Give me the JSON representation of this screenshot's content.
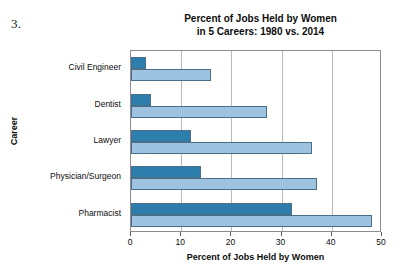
{
  "item_number": "3.",
  "chart_data": {
    "type": "bar",
    "orientation": "horizontal",
    "title": "Percent of Jobs Held by Women in 5 Careers: 1980 vs. 2014",
    "title_lines": [
      "Percent of Jobs Held by Women",
      "in 5 Careers: 1980 vs. 2014"
    ],
    "xlabel": "Percent of Jobs Held by Women",
    "ylabel": "Career",
    "categories": [
      "Civil Engineer",
      "Dentist",
      "Lawyer",
      "Physician/Surgeon",
      "Pharmacist"
    ],
    "series": [
      {
        "name": "1980",
        "color": "#2e7ead",
        "values": [
          3,
          4,
          12,
          14,
          32
        ]
      },
      {
        "name": "2014",
        "color": "#9dc3e0",
        "values": [
          16,
          27,
          36,
          37,
          48
        ]
      }
    ],
    "xlim": [
      0,
      50
    ],
    "xticks": [
      0,
      10,
      20,
      30,
      40,
      50
    ],
    "xtick_labels": [
      "0",
      "10",
      "20",
      "30",
      "40",
      "50"
    ],
    "grid": "vertical",
    "legend": "none"
  }
}
